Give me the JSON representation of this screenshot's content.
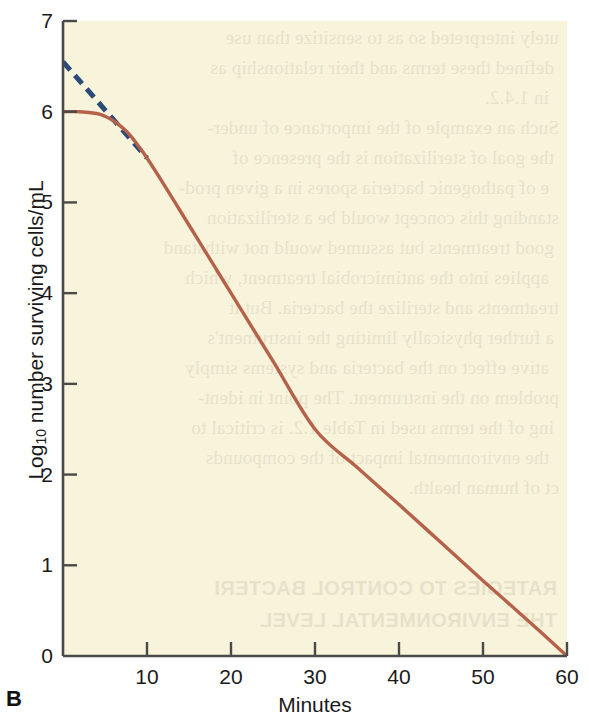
{
  "figure": {
    "panel_letter": "B",
    "background_color": "#ffffff",
    "plot_background_color": "#f8f3db"
  },
  "axes": {
    "y_title_prefix": "Log",
    "y_title_subscript": "10",
    "y_title_suffix": " number surviving cells/mL",
    "x_title": "Minutes",
    "y_ticks": [
      "0",
      "1",
      "2",
      "3",
      "4",
      "5",
      "6",
      "7"
    ],
    "x_ticks": [
      "10",
      "20",
      "30",
      "40",
      "50",
      "60"
    ],
    "axis_color": "#4a4a48"
  },
  "ghost_text": {
    "lines": [
      "utely interpreted so as to sensitize than use",
      "defined these terms and their relationship as",
      "in 1.4.2.",
      "Such an example of the importance of under-",
      "the goal of sterilization is the presence of",
      "e of pathogenic bacteria spores in a given prod-",
      "standing this concept would be a sterilization",
      "good treatments but assumed would not withstand",
      "applies into the antimicrobial treatment, which",
      "treatments and sterilize the bacteria. But it",
      "a further physically limiting the instrument's",
      "ative effect on the bacteria and systems simply",
      "problem on the instrument. The point in ident-",
      "ing of the terms used in Table 1.2. is critical to",
      "the environmental impact of the compounds",
      "ct of human health."
    ],
    "headings": [
      "RATEGIES TO CONTROL BACTERI",
      "THE ENVIRONMENTAL LEVEL"
    ]
  },
  "chart_data": {
    "type": "line",
    "title": "",
    "xlabel": "Minutes",
    "ylabel": "Log10 number surviving cells/mL",
    "xlim": [
      0,
      60
    ],
    "ylim": [
      0,
      7
    ],
    "grid": false,
    "legend": "none",
    "series": [
      {
        "name": "Survivor curve (shoulder type)",
        "style": "solid",
        "color": "#b5624a",
        "x": [
          0,
          2,
          4,
          5,
          6,
          7,
          8,
          9,
          10,
          12,
          14,
          16,
          18,
          20,
          25,
          30,
          35,
          40,
          45,
          50,
          55,
          60
        ],
        "y": [
          6.0,
          6.0,
          5.98,
          5.95,
          5.9,
          5.83,
          5.74,
          5.62,
          5.49,
          5.2,
          4.9,
          4.6,
          4.3,
          4.0,
          3.25,
          2.5,
          2.08,
          1.67,
          1.25,
          0.83,
          0.42,
          0.0
        ]
      },
      {
        "name": "Extrapolated exponential-death line",
        "style": "dashed",
        "color": "#2b4a78",
        "x": [
          0,
          10
        ],
        "y": [
          6.55,
          5.49
        ]
      }
    ],
    "annotations": [
      "Shoulder region from 0 to about 8 minutes where the survivor count stays near 6.0",
      "Linear exponential-death phase reaching 0 at 60 minutes",
      "Dashed navy line extrapolates the linear death rate back to 6.55 at time zero"
    ]
  }
}
